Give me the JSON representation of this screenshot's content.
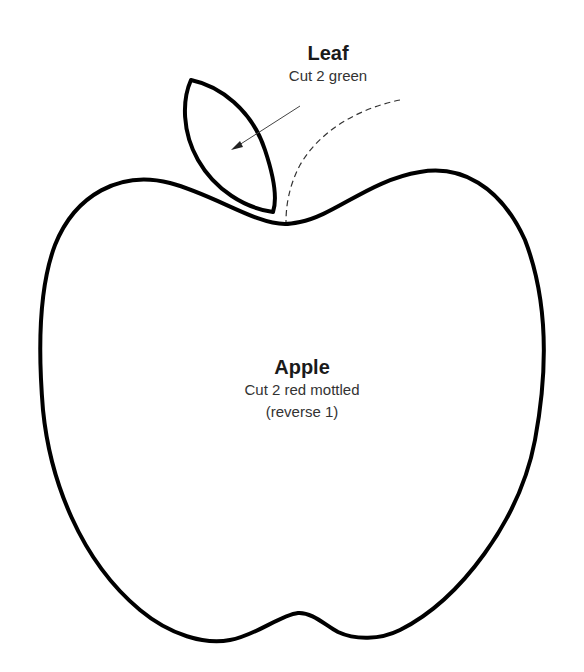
{
  "pattern": {
    "leaf": {
      "title": "Leaf",
      "instruction": "Cut 2 green"
    },
    "apple": {
      "title": "Apple",
      "instruction": "Cut 2 red mottled",
      "note": "(reverse 1)"
    }
  },
  "colors": {
    "outline": "#000000",
    "background": "#ffffff",
    "text": "#222222",
    "guide": "#333333"
  }
}
